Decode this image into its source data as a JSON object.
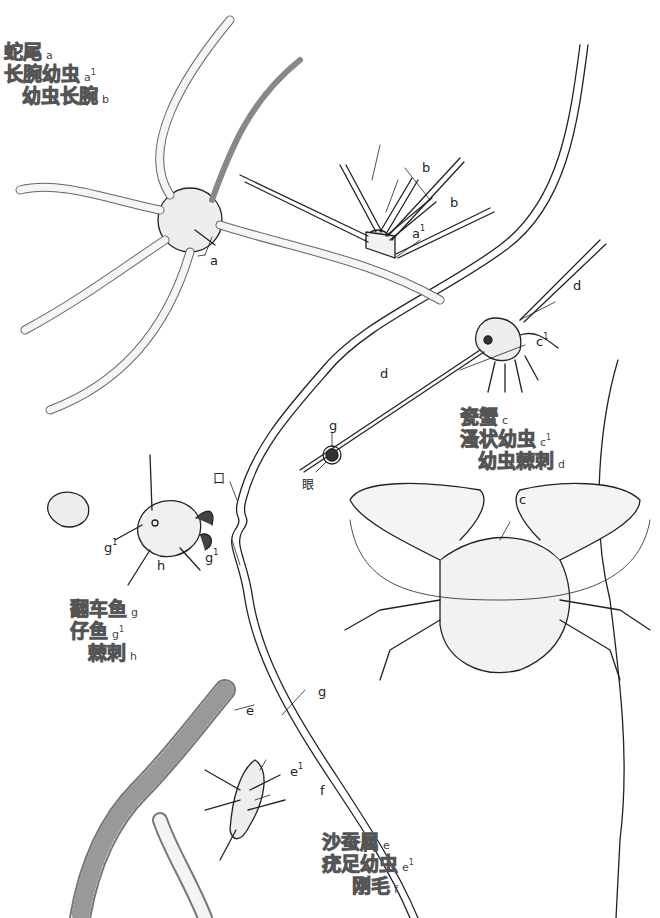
{
  "legends": {
    "brittle_star": [
      {
        "name": "蛇尾",
        "tag": "a",
        "sup": ""
      },
      {
        "name": "长腕幼虫",
        "tag": "a",
        "sup": "1"
      },
      {
        "name": "幼虫长腕",
        "tag": "b",
        "sup": ""
      }
    ],
    "crab": [
      {
        "name": "瓷蟹",
        "tag": "c",
        "sup": ""
      },
      {
        "name": "溞状幼虫",
        "tag": "c",
        "sup": "1"
      },
      {
        "name": "幼虫棘刺",
        "tag": "d",
        "sup": ""
      }
    ],
    "sunfish": [
      {
        "name": "翻车鱼",
        "tag": "g",
        "sup": ""
      },
      {
        "name": "仔鱼",
        "tag": "g",
        "sup": "1"
      },
      {
        "name": "棘刺",
        "tag": "h",
        "sup": ""
      }
    ],
    "worm": [
      {
        "name": "沙蚕属",
        "tag": "e",
        "sup": ""
      },
      {
        "name": "疣足幼虫",
        "tag": "e",
        "sup": "1"
      },
      {
        "name": "刚毛",
        "tag": "f",
        "sup": ""
      }
    ]
  },
  "figure_labels": {
    "a": "a",
    "a1": "a",
    "a1_sup": "1",
    "b1": "b",
    "b2": "b",
    "c": "c",
    "c1": "c",
    "c1_sup": "1",
    "d1": "d",
    "d2": "d",
    "e": "e",
    "e1": "e",
    "e1_sup": "1",
    "f": "f",
    "g_eye": "g",
    "g_outline": "g",
    "g1_left": "g",
    "g1_left_sup": "1",
    "g1_right": "g",
    "g1_right_sup": "1",
    "h": "h",
    "mouth": "口",
    "eye": "眼"
  },
  "colors": {
    "ink": "#222222",
    "legend_stroke": "#555555",
    "background": "#ffffff"
  }
}
